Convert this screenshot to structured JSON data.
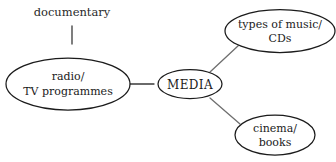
{
  "diagram": {
    "type": "mind-map",
    "center": {
      "label": "MEDIA"
    },
    "free_labels": [
      {
        "id": "documentary",
        "text": "documentary"
      }
    ],
    "nodes": [
      {
        "id": "radio-tv",
        "line1": "radio/",
        "line2": "TV programmes"
      },
      {
        "id": "music-cds",
        "line1": "types of music/",
        "line2": "CDs"
      },
      {
        "id": "cinema-books",
        "line1": "cinema/",
        "line2": "books"
      }
    ],
    "colors": {
      "stroke": "#1b1b1b",
      "connector": "#6f6f6f",
      "background": "#ffffff",
      "text": "#1b1b1b"
    }
  }
}
